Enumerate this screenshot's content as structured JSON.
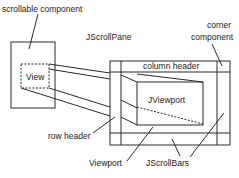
{
  "diagram": {
    "labels": {
      "scrollable_component": "scrollable component",
      "jscrollpane": "JScrollPane",
      "corner_component_line1": "corner",
      "corner_component_line2": "component",
      "column_header": "column header",
      "view": "View",
      "jviewport": "JViewport",
      "row_header": "row header",
      "viewport": "Viewport",
      "jscrollbars": "JScrollBars"
    },
    "colors": {
      "line": "#2a2a2a",
      "text": "#1a1a1a",
      "background": "#ffffff"
    }
  }
}
